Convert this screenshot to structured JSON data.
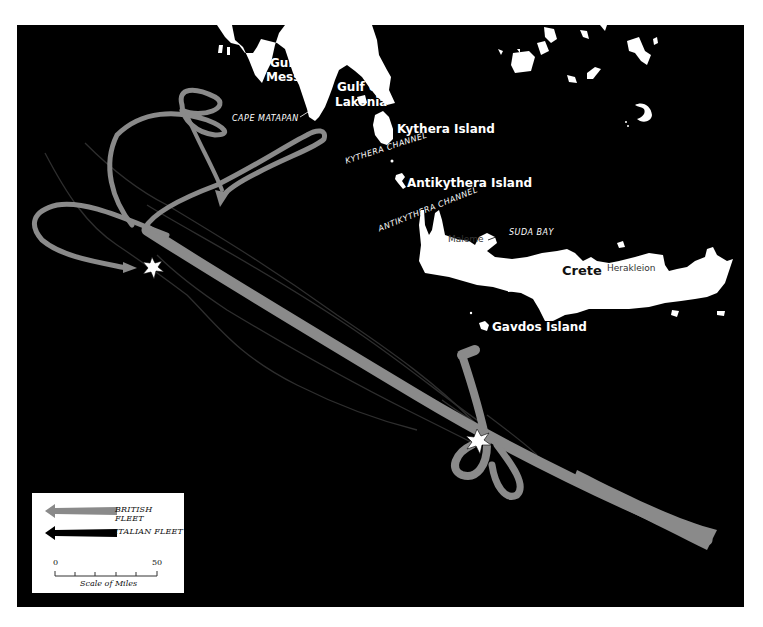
{
  "map": {
    "background_color": "#000000",
    "land_color": "#ffffff",
    "british_color": "#8a8a8a",
    "italian_color": "#2e2e2e",
    "labels": {
      "greece": "Greece",
      "gulf_messene": [
        "Gulf of",
        "Messene"
      ],
      "gulf_lakonia": [
        "Gulf of",
        "Lakonia"
      ],
      "cape_matapan": "CAPE MATAPAN",
      "kythera_island": "Kythera Island",
      "kythera_channel": "KYTHERA CHANNEL",
      "antikythera_island": "Antikythera Island",
      "antikythera_channel": "ANTIKYTHERA CHANNEL",
      "suda_bay": "SUDA BAY",
      "maleme": "Maleme",
      "crete": "Crete",
      "herakleion": "Herakleion",
      "gavdos_island": "Gavdos Island"
    },
    "battle_sites": [
      {
        "name": "engagement-1",
        "x": 135,
        "y": 243
      },
      {
        "name": "engagement-2",
        "x": 460,
        "y": 418
      }
    ]
  },
  "legend": {
    "items": [
      {
        "label": "BRITISH FLEET",
        "color": "#8a8a8a"
      },
      {
        "label": "ITALIAN FLEET",
        "color": "#000000"
      }
    ],
    "scale": {
      "start": "0",
      "end": "50",
      "title": "Scale of Miles"
    }
  }
}
